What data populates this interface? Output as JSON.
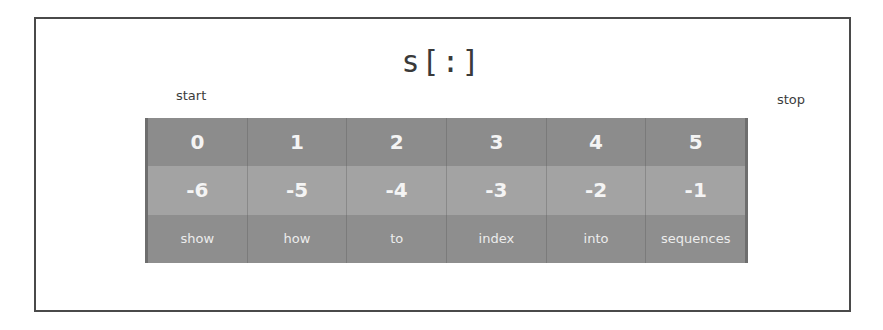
{
  "title": "s[:]",
  "labels": {
    "start": "start",
    "stop": "stop"
  },
  "table": {
    "positive_indices": [
      "0",
      "1",
      "2",
      "3",
      "4",
      "5"
    ],
    "negative_indices": [
      "-6",
      "-5",
      "-4",
      "-3",
      "-2",
      "-1"
    ],
    "words": [
      "show",
      "how",
      "to",
      "index",
      "into",
      "sequences"
    ]
  },
  "colors": {
    "row_positive": "#8c8c8c",
    "row_negative": "#a3a3a3",
    "row_words": "#8e8e8e",
    "frame_border": "#4a4a4a",
    "cell_text": "#f4f4f4"
  }
}
